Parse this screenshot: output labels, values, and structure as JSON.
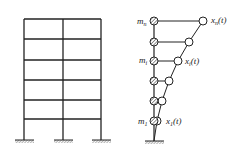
{
  "figure": {
    "left_panel": {
      "description": "Multi-story plane frame, 2 bays, 5 stories, fixed supports",
      "columns_x": [
        24,
        63,
        101
      ],
      "floors_y": [
        19,
        39,
        60,
        80,
        100,
        119
      ],
      "ground_y": 140
    },
    "right_panel": {
      "description": "Lumped-mass shear model with deformed shape",
      "stick_x": 154,
      "ground_y": 141,
      "masses": [
        {
          "y": 21,
          "dx": 203,
          "label_mass": "m",
          "label_mass_sub": "n",
          "label_disp": "x",
          "label_disp_sub": "n",
          "label_disp_arg": "(t)"
        },
        {
          "y": 42,
          "dx": 189
        },
        {
          "y": 61,
          "dx": 178,
          "label_mass": "m",
          "label_mass_sub": "i",
          "label_disp": "x",
          "label_disp_sub": "i",
          "label_disp_arg": "(t)"
        },
        {
          "y": 81,
          "dx": 169
        },
        {
          "y": 101,
          "dx": 162
        },
        {
          "y": 121,
          "dx": 157,
          "label_mass": "m",
          "label_mass_sub": "1",
          "label_disp": "x",
          "label_disp_sub": "1",
          "label_disp_arg": "(t)"
        }
      ]
    },
    "labels": {
      "mn": "m",
      "mn_sub": "n",
      "mi": "m",
      "mi_sub": "i",
      "m1": "m",
      "m1_sub": "1",
      "xn": "x",
      "xn_sub": "n",
      "xn_arg": "(t)",
      "xi": "x",
      "xi_sub": "i",
      "xi_arg": "(t)",
      "x1": "x",
      "x1_sub": "1",
      "x1_arg": "(t)"
    },
    "colors": {
      "line": "#222222",
      "background": "#ffffff"
    }
  }
}
